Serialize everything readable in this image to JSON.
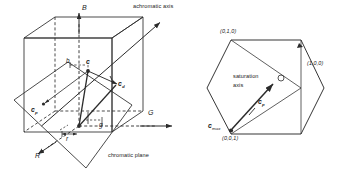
{
  "figure": {
    "stroke_color": "#2b2b2b",
    "text_color": "#1a1a1a",
    "background": "#ffffff"
  },
  "cube_diagram": {
    "axes": {
      "blue_axis_label": "B",
      "green_axis_label": "G",
      "red_axis_label": "R"
    },
    "annotations": {
      "achromatic_axis": "achromatic axis",
      "chromatic_plane": "chromatic plane"
    },
    "vectors": {
      "color_vector": "c",
      "projection_vector_prefix": "c",
      "projection_vector_sub": "p",
      "diagonal_vector_prefix": "c",
      "diagonal_vector_sub": "d"
    },
    "components": {
      "blue_component": "b",
      "red_component": "r",
      "green_component": "g"
    }
  },
  "hex_diagram": {
    "vertices": {
      "green_vertex": "(0,1,0)",
      "red_vertex": "(1,0,0)",
      "blue_vertex": "(0,0,1)"
    },
    "annotations": {
      "saturation_axis_line1": "saturation",
      "saturation_axis_line2": "axis"
    },
    "vectors": {
      "projection_vector_prefix": "c",
      "projection_vector_sub": "p",
      "max_vector_prefix": "c",
      "max_vector_sub": "max"
    },
    "marks": {
      "point_circle": "open-circle-point"
    }
  }
}
